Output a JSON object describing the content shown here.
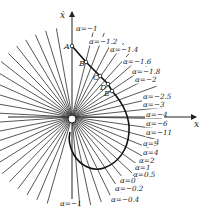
{
  "figure": {
    "type": "phase-plane isocline diagram",
    "axes": {
      "x_label": "x",
      "y_label": "ẋ"
    },
    "origin_px": [
      72,
      117
    ],
    "points": [
      {
        "name": "A",
        "x": 72,
        "y": 46,
        "lx": 64,
        "ly": 49
      },
      {
        "name": "B",
        "x": 86,
        "y": 62,
        "lx": 79,
        "ly": 66
      },
      {
        "name": "C",
        "x": 100,
        "y": 76,
        "lx": 93,
        "ly": 80
      },
      {
        "name": "D",
        "x": 108,
        "y": 84,
        "lx": 100,
        "ly": 90
      },
      {
        "name": "E",
        "x": 112,
        "y": 91,
        "lx": 104,
        "ly": 96
      }
    ],
    "isocline_labels": [
      {
        "text": "α=−1",
        "x": 76,
        "y": 31
      },
      {
        "text": "α=−1.2",
        "x": 89,
        "y": 44
      },
      {
        "text": "α=−1.4",
        "x": 110,
        "y": 52
      },
      {
        "text": "α=−1.6",
        "x": 123,
        "y": 64
      },
      {
        "text": "α=−1.8",
        "x": 132,
        "y": 74
      },
      {
        "text": "α=−2",
        "x": 135,
        "y": 82
      },
      {
        "text": "α=−2.5",
        "x": 143,
        "y": 99
      },
      {
        "text": "α=−3",
        "x": 143,
        "y": 107
      },
      {
        "text": "α=−4",
        "x": 146,
        "y": 117
      },
      {
        "text": "α=−6",
        "x": 146,
        "y": 126
      },
      {
        "text": "α=−11",
        "x": 146,
        "y": 135
      },
      {
        "text": "α=9",
        "x": 143,
        "y": 146
      },
      {
        "text": "α=4",
        "x": 143,
        "y": 155
      },
      {
        "text": "α=2",
        "x": 139,
        "y": 163
      },
      {
        "text": "α=1",
        "x": 135,
        "y": 170
      },
      {
        "text": "α=0.5",
        "x": 133,
        "y": 177
      },
      {
        "text": "α=0",
        "x": 120,
        "y": 183
      },
      {
        "text": "α=−0.2",
        "x": 115,
        "y": 191
      },
      {
        "text": "α=−0.4",
        "x": 111,
        "y": 202
      },
      {
        "text": "α=−1",
        "x": 60,
        "y": 206
      }
    ]
  }
}
